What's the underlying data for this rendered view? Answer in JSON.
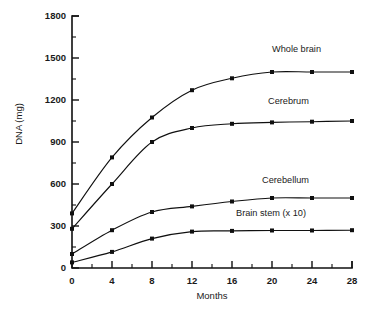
{
  "chart_data": {
    "type": "line",
    "title": "",
    "subtitle": "",
    "xlabel": "Months",
    "ylabel": "DNA (mg)",
    "xlim": [
      0,
      28
    ],
    "ylim": [
      0,
      1800
    ],
    "grid": false,
    "legend_position": "inline-right-of-curve",
    "x_ticks_major": [
      0,
      4,
      8,
      12,
      16,
      20,
      24,
      28
    ],
    "x_ticks_major_labels": [
      "0",
      "4",
      "8",
      "12",
      "16",
      "20",
      "24",
      "28"
    ],
    "x_ticks_minor": [
      2,
      6,
      10,
      14,
      18,
      22,
      26
    ],
    "y_ticks_major": [
      0,
      300,
      600,
      900,
      1200,
      1500,
      1800
    ],
    "y_ticks_major_labels": [
      "0",
      "300",
      "600",
      "900",
      "1200",
      "1500",
      "1800"
    ],
    "y_ticks_minor": [
      150,
      450,
      750,
      1050,
      1350,
      1650
    ],
    "marker_style": "filled-square",
    "x": [
      0,
      4,
      8,
      12,
      16,
      20,
      24,
      28
    ],
    "series": [
      {
        "name": "Whole brain",
        "label": "Whole brain",
        "color": "#101010",
        "values": [
          390,
          790,
          1075,
          1270,
          1355,
          1400,
          1400,
          1400
        ],
        "label_x": 20.0,
        "label_y": 1540
      },
      {
        "name": "Cerebrum",
        "label": "Cerebrum",
        "color": "#101010",
        "values": [
          280,
          600,
          900,
          1000,
          1030,
          1040,
          1045,
          1050
        ],
        "label_x": 19.6,
        "label_y": 1175
      },
      {
        "name": "Cerebellum",
        "label": "Cerebellum",
        "color": "#101010",
        "values": [
          100,
          270,
          400,
          440,
          475,
          500,
          500,
          500
        ],
        "label_x": 19.0,
        "label_y": 610
      },
      {
        "name": "Brain stem (x 10)",
        "label": "Brain stem (x 10)",
        "color": "#101010",
        "values": [
          40,
          115,
          210,
          260,
          265,
          268,
          268,
          270
        ],
        "label_x": 16.4,
        "label_y": 375
      }
    ]
  }
}
